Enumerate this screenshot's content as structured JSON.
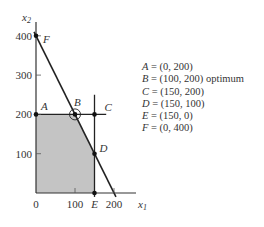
{
  "chart_data": {
    "type": "line",
    "title": "",
    "xlabel": "x1",
    "ylabel": "x2",
    "xlim": [
      0,
      220
    ],
    "ylim": [
      0,
      420
    ],
    "x_ticks": [
      {
        "value": 0,
        "label": "0"
      },
      {
        "value": 100,
        "label": "100"
      },
      {
        "value": 200,
        "label": "200"
      }
    ],
    "x_extra_labels": [
      {
        "value": 150,
        "label": "E"
      }
    ],
    "y_ticks": [
      {
        "value": 100,
        "label": "100"
      },
      {
        "value": 200,
        "label": "200"
      },
      {
        "value": 300,
        "label": "300"
      },
      {
        "value": 400,
        "label": "400"
      }
    ],
    "feasible_region": [
      [
        0,
        0
      ],
      [
        0,
        200
      ],
      [
        100,
        200
      ],
      [
        150,
        100
      ],
      [
        150,
        0
      ]
    ],
    "constraint_lines": [
      {
        "name": "x2 = 200",
        "points": [
          [
            0,
            200
          ],
          [
            180,
            200
          ]
        ]
      },
      {
        "name": "x1 = 150",
        "points": [
          [
            150,
            -10
          ],
          [
            150,
            250
          ]
        ]
      },
      {
        "name": "2x1 + x2 = 400",
        "points": [
          [
            -5,
            410
          ],
          [
            205,
            -10
          ]
        ]
      }
    ],
    "points": [
      {
        "name": "A",
        "x": 0,
        "y": 200
      },
      {
        "name": "B",
        "x": 100,
        "y": 200,
        "note": "optimum"
      },
      {
        "name": "C",
        "x": 150,
        "y": 200
      },
      {
        "name": "D",
        "x": 150,
        "y": 100
      },
      {
        "name": "E",
        "x": 150,
        "y": 0
      },
      {
        "name": "F",
        "x": 0,
        "y": 400
      }
    ],
    "optimum": "B",
    "grid": false
  },
  "legend": [
    {
      "name": "A",
      "text": " = (0, 200)"
    },
    {
      "name": "B",
      "text": " = (100, 200) optimum"
    },
    {
      "name": "C",
      "text": " = (150, 200)"
    },
    {
      "name": "D",
      "text": " = (150, 100)"
    },
    {
      "name": "E",
      "text": " = (150, 0)"
    },
    {
      "name": "F",
      "text": " = (0, 400)"
    }
  ]
}
